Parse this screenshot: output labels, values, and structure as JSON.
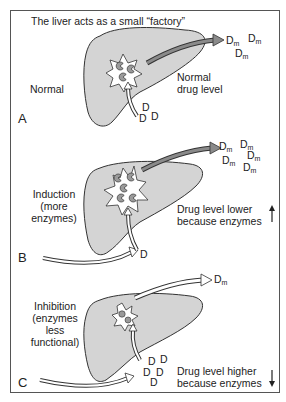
{
  "title": "The liver acts as a small “factory”",
  "panels": [
    {
      "letter": "A",
      "condition": [
        "Normal"
      ],
      "outcome": [
        "Normal",
        "drug level"
      ],
      "drug_symbol": "D",
      "metabolite_symbol": "D",
      "metabolite_sub": "m",
      "drug_count": 3,
      "metabolite_count": 3
    },
    {
      "letter": "B",
      "condition": [
        "Induction",
        "(more",
        "enzymes)"
      ],
      "outcome": [
        "Drug level lower",
        "because enzymes"
      ],
      "outcome_arrow": "up-arrow",
      "drug_symbol": "D",
      "metabolite_symbol": "D",
      "metabolite_sub": "m",
      "drug_count": 1,
      "metabolite_count": 5
    },
    {
      "letter": "C",
      "condition": [
        "Inhibition",
        "(enzymes",
        "less",
        "functional)"
      ],
      "outcome": [
        "Drug level higher",
        "because enzymes"
      ],
      "outcome_arrow": "down-arrow",
      "drug_symbol": "D",
      "metabolite_symbol": "D",
      "metabolite_sub": "m",
      "drug_count": 5,
      "metabolite_count": 1
    }
  ],
  "colors": {
    "liver_fill": "#d4d4d4",
    "outline": "#333333",
    "enzyme_fill": "#9a9a9a",
    "arrow_fill": "#ffffff",
    "arrow_fill_dark": "#8a8a8a"
  }
}
